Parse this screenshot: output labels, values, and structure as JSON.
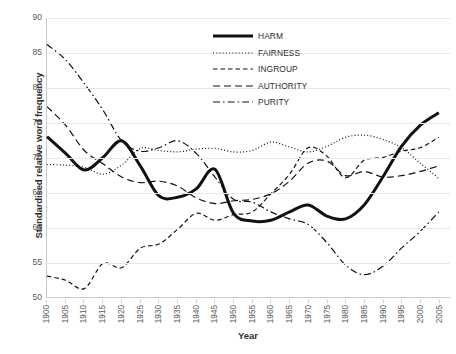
{
  "chart_data": {
    "type": "line",
    "title": "",
    "xlabel": "Year",
    "ylabel": "Standardised relative word frequency",
    "xlim": [
      1900,
      2008
    ],
    "ylim": [
      50,
      90
    ],
    "ytick_step": 5,
    "xtick_step": 5,
    "grid": true,
    "legend_position": "upper-center",
    "yticks": [
      "90",
      "85",
      "80",
      "75",
      "70",
      "65",
      "60",
      "55",
      "50"
    ],
    "xticks": [
      "1900",
      "1905",
      "1910",
      "1915",
      "1920",
      "1925",
      "1930",
      "1935",
      "1940",
      "1945",
      "1950",
      "1955",
      "1960",
      "1965",
      "1970",
      "1975",
      "1980",
      "1985",
      "1990",
      "1995",
      "2000",
      "2005"
    ],
    "x": [
      1900,
      1905,
      1910,
      1915,
      1920,
      1925,
      1930,
      1935,
      1940,
      1945,
      1950,
      1955,
      1960,
      1965,
      1970,
      1975,
      1980,
      1985,
      1990,
      1995,
      2000,
      2005
    ],
    "series": [
      {
        "name": "HARM",
        "style": "solid-thick",
        "values": [
          73.0,
          70.6,
          68.2,
          70.0,
          72.4,
          68.8,
          64.5,
          64.3,
          65.5,
          68.3,
          62.0,
          60.9,
          61.0,
          62.2,
          63.2,
          61.6,
          61.2,
          63.2,
          67.2,
          71.6,
          74.6,
          76.4
        ]
      },
      {
        "name": "FAIRNESS",
        "style": "dotted",
        "values": [
          69.0,
          68.9,
          68.6,
          67.6,
          68.9,
          71.3,
          71.0,
          70.8,
          71.2,
          71.3,
          70.8,
          71.0,
          72.2,
          71.5,
          70.8,
          71.6,
          72.9,
          73.2,
          72.6,
          71.4,
          69.2,
          67.0
        ]
      },
      {
        "name": "INGROUP",
        "style": "dashed",
        "values": [
          53.0,
          52.4,
          51.2,
          54.8,
          54.2,
          57.0,
          57.6,
          59.7,
          62.0,
          61.0,
          61.8,
          62.2,
          64.8,
          67.6,
          71.4,
          70.2,
          67.1,
          69.6,
          70.0,
          70.9,
          71.4,
          72.9
        ]
      },
      {
        "name": "AUTHORITY",
        "style": "long-dash",
        "values": [
          77.3,
          74.6,
          71.0,
          69.1,
          67.2,
          66.4,
          66.6,
          65.9,
          64.2,
          63.4,
          63.8,
          64.0,
          64.8,
          66.6,
          69.2,
          69.5,
          67.4,
          68.0,
          67.2,
          67.4,
          68.0,
          68.8
        ]
      },
      {
        "name": "PURITY",
        "style": "dash-dot",
        "values": [
          86.2,
          84.0,
          80.6,
          76.8,
          72.4,
          70.9,
          71.4,
          72.4,
          70.6,
          67.2,
          64.0,
          63.6,
          62.2,
          61.2,
          60.4,
          57.8,
          54.6,
          53.2,
          54.4,
          57.0,
          59.4,
          62.2
        ]
      }
    ]
  },
  "legend": {
    "items": [
      {
        "label": "HARM"
      },
      {
        "label": "FAIRNESS"
      },
      {
        "label": "INGROUP"
      },
      {
        "label": "AUTHORITY"
      },
      {
        "label": "PURITY"
      }
    ]
  }
}
